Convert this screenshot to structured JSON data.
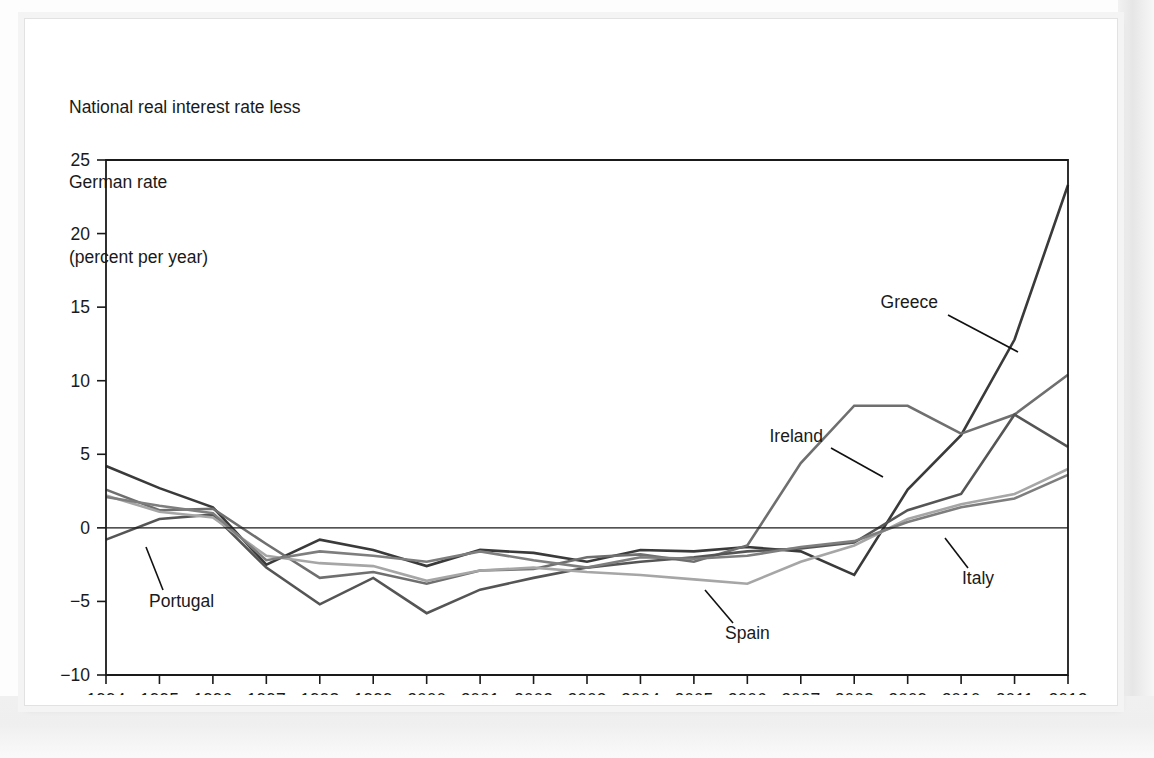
{
  "figure": {
    "caption_line1": "National real interest rate less",
    "caption_line2": "German rate",
    "caption_line3": "(percent per year)"
  },
  "chart_data": {
    "type": "line",
    "title": "National real interest rate less German rate",
    "subtitle": "(percent per year)",
    "xlabel": "",
    "ylabel": "percent per year",
    "ylim": [
      -10,
      25
    ],
    "yticks": [
      25,
      20,
      15,
      10,
      5,
      0,
      -5,
      -10
    ],
    "ytick_labels": [
      "25",
      "20",
      "15",
      "10",
      "5",
      "0",
      "−5",
      "−10"
    ],
    "grid": false,
    "zero_line": true,
    "legend_position": "inline-annotations",
    "x": [
      1994,
      1995,
      1996,
      1997,
      1998,
      1999,
      2000,
      2001,
      2002,
      2003,
      2004,
      2005,
      2006,
      2007,
      2008,
      2009,
      2010,
      2011,
      2012
    ],
    "xtick_labels": [
      "1994",
      "1995",
      "1996",
      "1997",
      "1998",
      "1999",
      "2000",
      "2001",
      "2002",
      "2003",
      "2004",
      "2005",
      "2006",
      "2007",
      "2008",
      "2009",
      "2010",
      "2011",
      "2012"
    ],
    "series": [
      {
        "name": "Greece",
        "color": "#3a3a3a",
        "width": 2.6,
        "values": [
          4.2,
          2.7,
          1.4,
          -2.5,
          -0.8,
          -1.5,
          -2.6,
          -1.5,
          -1.7,
          -2.3,
          -1.5,
          -1.6,
          -1.3,
          -1.6,
          -3.2,
          2.6,
          6.3,
          12.8,
          23.3
        ]
      },
      {
        "name": "Ireland",
        "color": "#6f6f6f",
        "width": 2.6,
        "values": [
          2.6,
          1.2,
          1.3,
          -1.1,
          -3.4,
          -3.0,
          -3.8,
          -2.9,
          -2.8,
          -2.0,
          -1.8,
          -2.3,
          -1.2,
          4.4,
          8.3,
          8.3,
          6.4,
          7.7,
          10.4
        ]
      },
      {
        "name": "Portugal",
        "color": "#555555",
        "width": 2.6,
        "values": [
          -0.8,
          0.6,
          0.9,
          -2.7,
          -5.2,
          -3.4,
          -5.8,
          -4.2,
          -3.4,
          -2.7,
          -2.3,
          -2.0,
          -1.6,
          -1.4,
          -1.0,
          1.2,
          2.3,
          7.7,
          5.5
        ]
      },
      {
        "name": "Spain",
        "color": "#a6a6a6",
        "width": 2.6,
        "values": [
          2.2,
          1.1,
          0.7,
          -1.9,
          -2.4,
          -2.6,
          -3.6,
          -2.9,
          -2.7,
          -3.0,
          -3.2,
          -3.5,
          -3.8,
          -2.3,
          -1.2,
          0.6,
          1.6,
          2.3,
          4.0
        ]
      },
      {
        "name": "Italy",
        "color": "#7e7e7e",
        "width": 2.6,
        "values": [
          2.1,
          1.5,
          1.0,
          -2.2,
          -1.6,
          -1.9,
          -2.3,
          -1.6,
          -2.2,
          -2.7,
          -2.0,
          -2.1,
          -1.9,
          -1.3,
          -0.9,
          0.4,
          1.4,
          2.0,
          3.6
        ]
      }
    ],
    "annotations": [
      {
        "label": "Greece",
        "text_x": 905,
        "text_y": 281,
        "anchor": "end",
        "leader": [
          [
            915,
            288
          ],
          [
            985,
            325
          ]
        ]
      },
      {
        "label": "Ireland",
        "text_x": 790,
        "text_y": 415,
        "anchor": "end",
        "leader": [
          [
            798,
            421
          ],
          [
            850,
            450
          ]
        ]
      },
      {
        "label": "Portugal",
        "text_x": 116,
        "text_y": 580,
        "anchor": "start",
        "leader": [
          [
            130,
            563
          ],
          [
            113,
            520
          ]
        ]
      },
      {
        "label": "Spain",
        "text_x": 692,
        "text_y": 612,
        "anchor": "start",
        "leader": [
          [
            700,
            596
          ],
          [
            672,
            563
          ]
        ]
      },
      {
        "label": "Italy",
        "text_x": 929,
        "text_y": 557,
        "anchor": "start",
        "leader": [
          [
            935,
            541
          ],
          [
            912,
            511
          ]
        ]
      }
    ]
  }
}
